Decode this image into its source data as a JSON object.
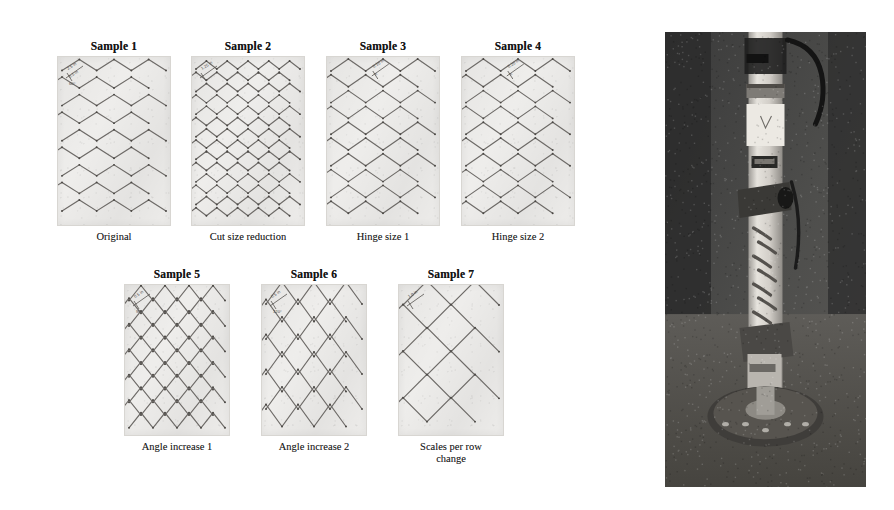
{
  "figure": {
    "kind": "research-figure",
    "background_color": "#ffffff",
    "panel_fill_color": "#f2f1ef",
    "cut_line_color": "#6d6a67",
    "node_color": "#4a4744",
    "photo_dark_color": "#3c3c3c",
    "photo_light_color": "#d9d7d2"
  },
  "samples": [
    {
      "id": "sample-1",
      "title": "Sample 1",
      "caption": "Original",
      "row": 1,
      "column": 1,
      "pattern": "chevron",
      "pattern_description": "zig-zag chevron rows, wide spacing",
      "rows": 9,
      "peaks_per_row": 3,
      "amplitude_px": 11,
      "x": 58,
      "y": 60,
      "width": 112,
      "height": 168,
      "annotation": {
        "dimension_labels": [
          "2.5 in",
          "0.5 in"
        ],
        "angle_label": "60°",
        "position": "top-left"
      }
    },
    {
      "id": "sample-2",
      "title": "Sample 2",
      "caption": "Cut size reduction",
      "row": 1,
      "column": 2,
      "pattern": "lattice",
      "pattern_description": "dense diamond lattice, reduced cut size",
      "rows": 14,
      "peaks_per_row": 5,
      "amplitude_px": 8,
      "x": 192,
      "y": 60,
      "width": 112,
      "height": 168,
      "annotation": {
        "dimension_labels": [
          "1.25 in"
        ],
        "angle_label": "",
        "position": "top-left"
      }
    },
    {
      "id": "sample-3",
      "title": "Sample 3",
      "caption": "Hinge size 1",
      "row": 1,
      "column": 3,
      "pattern": "chevron",
      "pattern_description": "chevron rows with increased hinge gap",
      "rows": 10,
      "peaks_per_row": 3,
      "amplitude_px": 12,
      "x": 327,
      "y": 60,
      "width": 112,
      "height": 168,
      "annotation": {
        "dimension_labels": [
          "0.10 in",
          "h"
        ],
        "angle_label": "",
        "position": "top-center"
      }
    },
    {
      "id": "sample-4",
      "title": "Sample 4",
      "caption": "Hinge size 2",
      "row": 1,
      "column": 4,
      "pattern": "chevron",
      "pattern_description": "chevron rows with larger hinge gap",
      "rows": 10,
      "peaks_per_row": 3,
      "amplitude_px": 12,
      "x": 462,
      "y": 60,
      "width": 112,
      "height": 168,
      "annotation": {
        "dimension_labels": [
          "0.20 in",
          "h"
        ],
        "angle_label": "",
        "position": "top-center"
      }
    },
    {
      "id": "sample-5",
      "title": "Sample 5",
      "caption": "Angle increase 1",
      "row": 2,
      "column": 1,
      "pattern": "lattice",
      "pattern_description": "steeper chevrons forming diamond lattice",
      "rows": 11,
      "peaks_per_row": 4,
      "amplitude_px": 15,
      "x": 125,
      "y": 288,
      "width": 104,
      "height": 150,
      "annotation": {
        "dimension_labels": [
          "0.5 in"
        ],
        "angle_label": "90°",
        "position": "top-left"
      }
    },
    {
      "id": "sample-6",
      "title": "Sample 6",
      "caption": "Angle increase 2",
      "row": 2,
      "column": 2,
      "pattern": "lattice",
      "pattern_description": "sharpest chevrons, tall narrow diamonds",
      "rows": 8,
      "peaks_per_row": 3,
      "amplitude_px": 22,
      "x": 262,
      "y": 288,
      "width": 104,
      "height": 150,
      "annotation": {
        "dimension_labels": [
          "0.5 in"
        ],
        "angle_label": "120°",
        "position": "top-left"
      }
    },
    {
      "id": "sample-7",
      "title": "Sample 7",
      "caption": "Scales per row\nchange",
      "row": 2,
      "column": 3,
      "pattern": "chevron",
      "pattern_description": "fewer, larger scales per row",
      "rows": 6,
      "peaks_per_row": 2,
      "amplitude_px": 24,
      "x": 399,
      "y": 288,
      "width": 104,
      "height": 150,
      "annotation": {
        "dimension_labels": [
          "1.0 in"
        ],
        "angle_label": "",
        "position": "top-left"
      }
    }
  ],
  "photo": {
    "id": "apparatus-photo",
    "description": "Photograph of a vertical tubular test specimen mounted in a load frame, with clamps, a sensor block and a bolted circular base flange",
    "x": 665,
    "y": 32,
    "width": 201,
    "height": 455,
    "parts": [
      {
        "name": "specimen-tube",
        "label": ""
      },
      {
        "name": "upper-clamp",
        "label": ""
      },
      {
        "name": "sensor-block",
        "label": ""
      },
      {
        "name": "lower-clamp",
        "label": ""
      },
      {
        "name": "base-flange",
        "label": ""
      },
      {
        "name": "cable",
        "label": ""
      }
    ]
  }
}
